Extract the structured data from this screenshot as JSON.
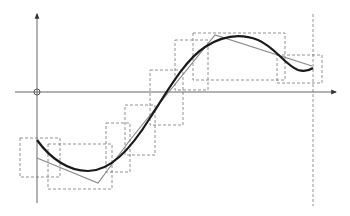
{
  "diagram": {
    "colors": {
      "background": "#ffffff",
      "axis": "#666666",
      "curve": "#1a1a1a",
      "approximation": "#888888",
      "dashed_box": "#777777",
      "origin_marker": "#555555"
    },
    "axes": {
      "x_axis": {
        "x1": 15,
        "y1": 92,
        "x2": 336,
        "y2": 92
      },
      "y_axis": {
        "x1": 37,
        "y1": 203,
        "x2": 37,
        "y2": 14
      },
      "origin": {
        "cx": 37,
        "cy": 92,
        "r": 3
      }
    },
    "vertical_dashed_line": {
      "x": 313,
      "y1": 14,
      "y2": 206
    },
    "curve_path": "M37,140 C50,158 68,171 88,171 C110,171 130,150 150,118 C168,90 185,60 205,47 C222,36 240,33 258,40 C275,47 285,65 298,70 C305,72 310,70 313,68",
    "approximation_points": "37,158 98,183 130,140 215,35 312,66",
    "dashed_boxes": [
      {
        "x": 20,
        "y": 138,
        "w": 40,
        "h": 39
      },
      {
        "x": 48,
        "y": 144,
        "w": 64,
        "h": 45
      },
      {
        "x": 106,
        "y": 123,
        "w": 24,
        "h": 49
      },
      {
        "x": 125,
        "y": 105,
        "w": 30,
        "h": 50
      },
      {
        "x": 150,
        "y": 70,
        "w": 33,
        "h": 55
      },
      {
        "x": 175,
        "y": 40,
        "w": 33,
        "h": 50
      },
      {
        "x": 193,
        "y": 33,
        "w": 92,
        "h": 47
      },
      {
        "x": 277,
        "y": 55,
        "w": 45,
        "h": 28
      }
    ]
  }
}
